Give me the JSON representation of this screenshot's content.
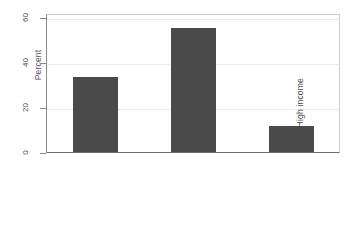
{
  "chart_data": {
    "type": "bar",
    "title": "",
    "xlabel": "",
    "ylabel": "Percent",
    "categories": [
      "Low income",
      "Medium income",
      "High income"
    ],
    "values": [
      33.5,
      55.5,
      11.5
    ],
    "ylim": [
      0,
      62
    ],
    "yticks": [
      0,
      20,
      40,
      60
    ],
    "ytick_labels": [
      "0",
      "20",
      "40",
      "60"
    ],
    "grid": true,
    "grid_axis": "y",
    "legend": false,
    "bar_color": "#4a4a4a",
    "background_color": "#ffffff",
    "frame_color": "#cfcfcf",
    "axis_color": "#6d6d6d",
    "gridline_color": "#ebebeb",
    "xtick_label_rotation": 90,
    "ytick_label_rotation": 90
  }
}
